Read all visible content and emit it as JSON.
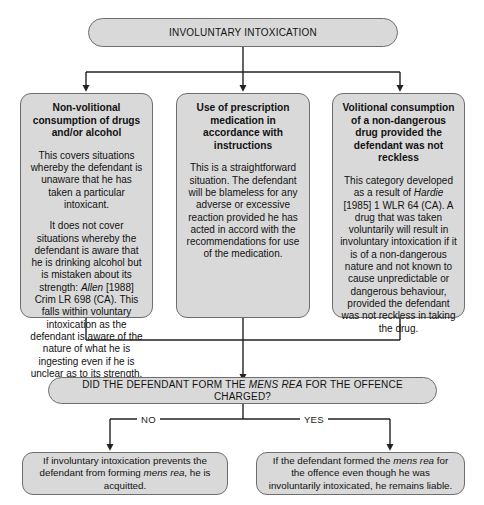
{
  "diagram": {
    "title": "INVOLUNTARY INTOXICATION",
    "colors": {
      "node_fill": "#d9d9d9",
      "node_border": "#6e6e6e",
      "connector": "#222222",
      "background": "#ffffff",
      "text": "#121212"
    },
    "root": {
      "label": "INVOLUNTARY INTOXICATION"
    },
    "branches": [
      {
        "heading": "Non-volitional consumption of drugs and/or alcohol",
        "paragraphs": [
          "This covers situations whereby the defendant is unaware that he has taken a particular intoxicant.",
          "It does not cover situations whereby the defendant is aware that he is drinking alcohol but is mistaken about its strength: Allen [1988] Crim LR 698 (CA). This falls within voluntary intoxication as the defendant is aware of the nature of what he is ingesting even if he is unclear as to its strength."
        ],
        "citation": "Allen"
      },
      {
        "heading": "Use of prescription medication in accordance with instructions",
        "paragraphs": [
          "This is a straightforward situation. The defendant will be blameless for any adverse or excessive reaction provided he has acted in accord with the recommendations for use of the medication."
        ],
        "citation": ""
      },
      {
        "heading": "Volitional consumption of a non-dangerous drug provided the defendant was not reckless",
        "paragraphs": [
          "This category developed as a result of Hardie [1985] 1 WLR 64 (CA). A drug that was taken voluntarily will result in involuntary intoxication if it is of a non-dangerous nature and not known to cause unpredictable or dangerous behaviour, provided the defendant was not reckless in taking the drug."
        ],
        "citation": "Hardie"
      }
    ],
    "decision": {
      "question_pre": "DID THE DEFENDANT FORM THE ",
      "question_em": "MENS REA",
      "question_post": " FOR THE OFFENCE CHARGED?"
    },
    "branch_labels": {
      "no": "NO",
      "yes": "YES"
    },
    "outcomes": [
      {
        "key": "no",
        "pre": "If involuntary intoxication prevents the defendant from forming ",
        "em": "mens rea",
        "post": ", he is acquitted."
      },
      {
        "key": "yes",
        "pre": "If the defendant formed the ",
        "em": "mens rea",
        "post": " for the offence even though he was involuntarily intoxicated, he remains liable."
      }
    ]
  }
}
